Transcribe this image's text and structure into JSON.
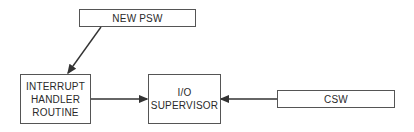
{
  "diagram": {
    "nodes": [
      {
        "id": "new-psw",
        "label": "NEW PSW"
      },
      {
        "id": "interrupt-handler",
        "label_lines": [
          "INTERRUPT",
          "HANDLER",
          "ROUTINE"
        ]
      },
      {
        "id": "io-supervisor",
        "label_lines": [
          "I/O",
          "SUPERVISOR"
        ]
      },
      {
        "id": "csw",
        "label": "CSW"
      }
    ],
    "edges": [
      {
        "from": "new-psw",
        "to": "interrupt-handler"
      },
      {
        "from": "interrupt-handler",
        "to": "io-supervisor"
      },
      {
        "from": "csw",
        "to": "io-supervisor"
      }
    ]
  }
}
